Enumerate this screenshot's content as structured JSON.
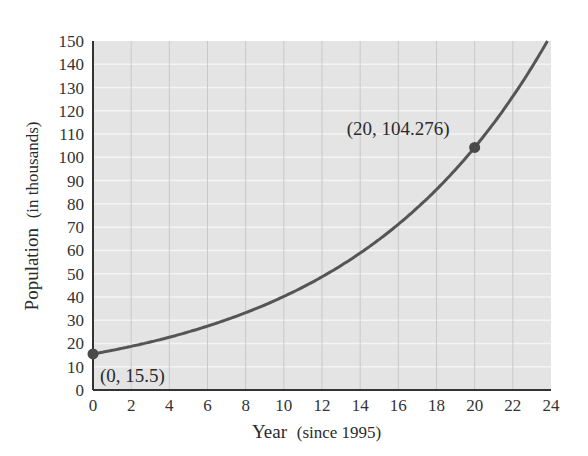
{
  "chart_data": {
    "type": "line",
    "title": "",
    "xlabel": "Year",
    "xlabel_note": "(since 1995)",
    "ylabel": "Population",
    "ylabel_note": "(in thousands)",
    "xlim": [
      0,
      24
    ],
    "ylim": [
      0,
      150
    ],
    "x_ticks": [
      0,
      2,
      4,
      6,
      8,
      10,
      12,
      14,
      16,
      18,
      20,
      22,
      24
    ],
    "y_ticks": [
      0,
      10,
      20,
      30,
      40,
      50,
      60,
      70,
      80,
      90,
      100,
      110,
      120,
      130,
      140,
      150
    ],
    "grid": true,
    "legend": null,
    "series": [
      {
        "name": "Population model",
        "model": "P(t) = 15.5 * e^(0.09531 t)",
        "x": [
          0,
          2,
          4,
          6,
          8,
          10,
          12,
          14,
          16,
          18,
          20,
          22,
          24
        ],
        "values": [
          15.5,
          18.7,
          22.6,
          27.4,
          33.1,
          40.0,
          48.4,
          58.5,
          70.7,
          85.5,
          104.3,
          126.1,
          152.7
        ]
      }
    ],
    "points": [
      {
        "x": 0,
        "y": 15.5,
        "label": "(0, 15.5)"
      },
      {
        "x": 20,
        "y": 104.276,
        "label": "(20, 104.276)"
      }
    ],
    "colors": {
      "plot_background": "#e4e4e4",
      "grid": "#f4f4f4",
      "vgrid": "#c9c9c9",
      "curve": "#555555",
      "axis": "#333333"
    }
  }
}
